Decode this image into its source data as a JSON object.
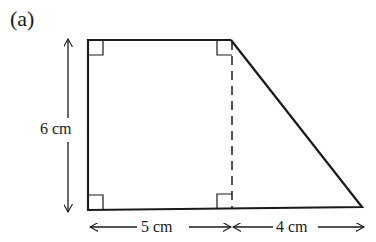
{
  "figure": {
    "part_label": "(a)",
    "shape": "trapezium",
    "dimensions": {
      "height": "6 cm",
      "rectangle_width": "5 cm",
      "triangle_base": "4 cm"
    },
    "colors": {
      "stroke": "#1a1a1a",
      "background": "#ffffff"
    }
  }
}
